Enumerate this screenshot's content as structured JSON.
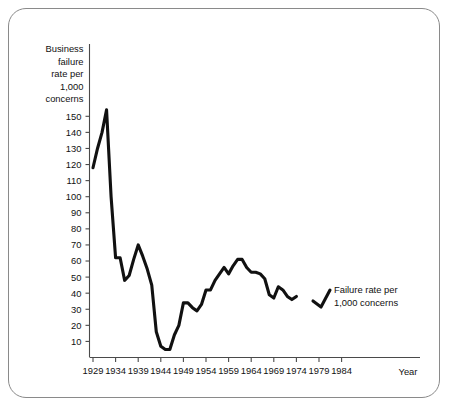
{
  "figure": {
    "frame_style": "rounded-rectangle-border",
    "border_color": "#8a8a8a",
    "background_color": "#ffffff"
  },
  "chart_data": {
    "type": "line",
    "title": "",
    "subtitle": "",
    "ylabel": "Business failure rate per 1,000 concerns",
    "ylabel_lines": [
      "Business",
      "failure",
      "rate per",
      "1,000",
      "concerns"
    ],
    "xlabel": "Year",
    "xlim": [
      1929,
      1986
    ],
    "ylim": [
      0,
      158
    ],
    "grid": false,
    "legend_position": "inline-annotation",
    "line_color": "#111111",
    "annotations": [
      {
        "text": "Failure rate per 1,000 concerns",
        "lines": [
          "Failure rate per",
          "1,000 concerns"
        ],
        "points_to_year": 1974
      }
    ],
    "yticks": [
      10,
      20,
      30,
      40,
      50,
      60,
      70,
      80,
      90,
      100,
      110,
      120,
      130,
      140,
      150
    ],
    "ytick_labels": [
      "10",
      "20",
      "30",
      "40",
      "50",
      "60",
      "70",
      "80",
      "90",
      "100",
      "110",
      "120",
      "130",
      "140",
      "150"
    ],
    "xticks": [
      1929,
      1934,
      1939,
      1944,
      1949,
      1954,
      1959,
      1964,
      1969,
      1974,
      1979,
      1984
    ],
    "xtick_labels": [
      "1929",
      "1934",
      "1939",
      "1944",
      "1949",
      "1954",
      "1959",
      "1964",
      "1969",
      "1974",
      "1979",
      "1984"
    ],
    "series": [
      {
        "name": "Failure rate per 1,000 concerns",
        "x": [
          1929,
          1930,
          1931,
          1932,
          1933,
          1934,
          1935,
          1936,
          1937,
          1938,
          1939,
          1940,
          1941,
          1942,
          1943,
          1944,
          1945,
          1946,
          1947,
          1948,
          1949,
          1950,
          1951,
          1952,
          1953,
          1954,
          1955,
          1956,
          1957,
          1958,
          1959,
          1960,
          1961,
          1962,
          1963,
          1964,
          1965,
          1966,
          1967,
          1968,
          1969,
          1970,
          1971,
          1972,
          1973,
          1974
        ],
        "values": [
          118,
          130,
          140,
          154,
          100,
          62,
          62,
          48,
          51,
          61,
          70,
          63,
          55,
          45,
          16,
          7,
          5,
          5,
          14,
          20,
          34,
          34,
          31,
          29,
          33,
          42,
          42,
          48,
          52,
          56,
          52,
          57,
          61,
          61,
          56,
          53,
          53,
          52,
          49,
          39,
          37,
          44,
          42,
          38,
          36,
          38
        ]
      }
    ]
  },
  "axes": {
    "y_axis_name": "y-axis",
    "x_axis_name": "x-axis"
  }
}
